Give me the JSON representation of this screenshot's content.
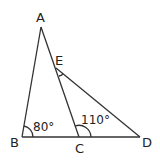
{
  "figure": {
    "type": "geometry",
    "points": {
      "A": {
        "label": "A",
        "x": 41,
        "y": 27
      },
      "B": {
        "label": "B",
        "x": 22,
        "y": 137
      },
      "C": {
        "label": "C",
        "x": 79,
        "y": 137
      },
      "D": {
        "label": "D",
        "x": 140,
        "y": 137
      },
      "E": {
        "label": "E",
        "x": 56,
        "y": 68
      }
    },
    "segments": [
      "AB",
      "AC",
      "BD",
      "ED"
    ],
    "angles": [
      {
        "vertex": "B",
        "label": "80°"
      },
      {
        "vertex": "C",
        "label": "110°"
      },
      {
        "vertex": "E",
        "label": ""
      }
    ],
    "stroke_color": "#333333"
  }
}
